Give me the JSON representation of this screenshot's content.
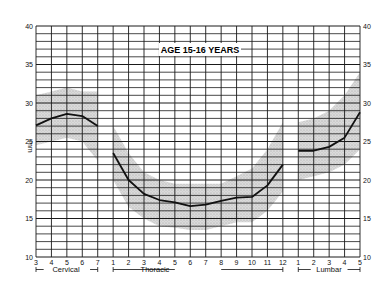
{
  "chart_data": {
    "type": "line",
    "title": "AGE 15-16 YEARS",
    "xlabel": "",
    "ylabel": "mm",
    "ylim": [
      10,
      40
    ],
    "yticks": [
      10,
      15,
      20,
      25,
      30,
      35,
      40
    ],
    "grid": true,
    "legend": null,
    "x_groups": [
      {
        "name": "Cervical",
        "categories": [
          "3",
          "4",
          "5",
          "6",
          "7"
        ]
      },
      {
        "name": "Thoracic",
        "categories": [
          "1",
          "2",
          "3",
          "4",
          "5",
          "6",
          "7",
          "8",
          "9",
          "10",
          "11",
          "12"
        ]
      },
      {
        "name": "Lumbar",
        "categories": [
          "1",
          "2",
          "3",
          "4",
          "5"
        ]
      }
    ],
    "series": [
      {
        "name": "Cervical mean",
        "group": "Cervical",
        "values": [
          27.1,
          28.0,
          28.6,
          28.3,
          27.0
        ],
        "band_lower": [
          24.5,
          25.0,
          25.5,
          25.0,
          22.5
        ],
        "band_upper": [
          31.0,
          31.5,
          32.0,
          31.5,
          31.5
        ]
      },
      {
        "name": "Thoracic mean",
        "group": "Thoracic",
        "values": [
          23.5,
          20.0,
          18.2,
          17.4,
          17.1,
          16.6,
          16.8,
          17.3,
          17.7,
          17.8,
          19.3,
          22.0
        ],
        "band_lower": [
          20.0,
          16.5,
          15.0,
          14.0,
          13.8,
          13.5,
          13.5,
          14.0,
          14.5,
          14.5,
          16.0,
          18.5
        ],
        "band_upper": [
          27.0,
          23.5,
          21.0,
          20.0,
          19.5,
          19.5,
          19.5,
          19.5,
          20.5,
          21.5,
          24.0,
          27.5
        ]
      },
      {
        "name": "Lumbar mean",
        "group": "Lumbar",
        "values": [
          23.8,
          23.8,
          24.3,
          25.5,
          28.8
        ],
        "band_lower": [
          20.0,
          20.5,
          21.0,
          22.0,
          24.0
        ],
        "band_upper": [
          27.5,
          28.0,
          29.0,
          31.0,
          34.0
        ]
      }
    ]
  },
  "labels": {
    "title": "AGE 15-16 YEARS",
    "y_unit": "mm",
    "region_cervical": "Cervical",
    "region_thoracic": "Thoracic",
    "region_lumbar": "Lumbar"
  },
  "colors": {
    "line": "#111111",
    "grid": "#1a1a1a",
    "band": "#c8c8c8"
  }
}
